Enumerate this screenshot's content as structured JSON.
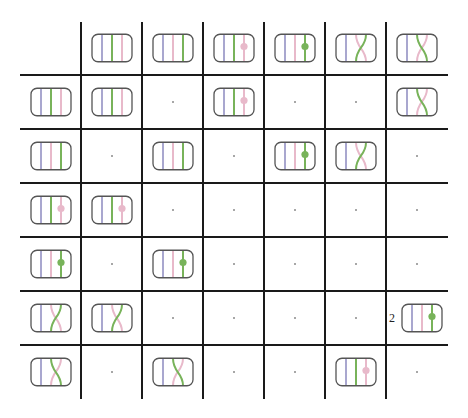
{
  "colors": {
    "strand_blue": "#a9a7cf",
    "strand_green": "#78b35a",
    "strand_pink": "#e8b9ca",
    "box_border": "#555555",
    "grid_line": "#1a1a1a",
    "empty_dot": "#8a8a8a"
  },
  "tile_types": {
    "T1": {
      "name": "identity-blue-green-pink",
      "order": [
        "blue",
        "green",
        "pink"
      ],
      "crossing": false,
      "dot": null
    },
    "T2": {
      "name": "identity-blue-pink-green",
      "order": [
        "blue",
        "pink",
        "green"
      ],
      "crossing": false,
      "dot": null
    },
    "T3": {
      "name": "blue-green-pink-pink-dot",
      "order": [
        "blue",
        "green",
        "pink"
      ],
      "crossing": false,
      "dot": "pink"
    },
    "T4": {
      "name": "blue-pink-green-green-dot",
      "order": [
        "blue",
        "pink",
        "green"
      ],
      "crossing": false,
      "dot": "green"
    },
    "T5": {
      "name": "crossing-green-up",
      "order": [
        "blue",
        "pink",
        "green"
      ],
      "crossing": "green-bl-to-tr",
      "dot": null
    },
    "T6": {
      "name": "crossing-green-down",
      "order": [
        "blue",
        "green",
        "pink"
      ],
      "crossing": "green-tl-to-br",
      "dot": null
    }
  },
  "column_headers": [
    "T1",
    "T2",
    "T3",
    "T4",
    "T5",
    "T6"
  ],
  "row_headers": [
    "T1",
    "T2",
    "T3",
    "T4",
    "T5",
    "T6"
  ],
  "cells": [
    [
      {
        "tile": "T1"
      },
      null,
      {
        "tile": "T3"
      },
      null,
      null,
      {
        "tile": "T6"
      }
    ],
    [
      null,
      {
        "tile": "T2"
      },
      null,
      {
        "tile": "T4"
      },
      {
        "tile": "T5"
      },
      null
    ],
    [
      {
        "tile": "T3"
      },
      null,
      null,
      null,
      null,
      null
    ],
    [
      null,
      {
        "tile": "T4"
      },
      null,
      null,
      null,
      null
    ],
    [
      {
        "tile": "T5"
      },
      null,
      null,
      null,
      null,
      {
        "tile": "T4",
        "coefficient": "2"
      }
    ],
    [
      null,
      {
        "tile": "T6"
      },
      null,
      null,
      {
        "tile": "T3"
      },
      null
    ]
  ],
  "empty_cell_marker": "·"
}
